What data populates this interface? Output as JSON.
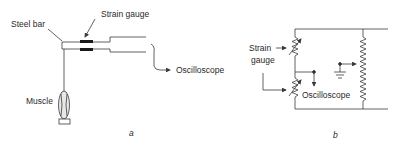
{
  "panel_a": {
    "label": "a",
    "steel_bar_label": "Steel bar",
    "strain_gauge_label": "Strain gauge",
    "oscilloscope_label": "Oscilloscope",
    "muscle_label": "Muscle"
  },
  "panel_b": {
    "label": "b",
    "strain_gauge_label_line1": "Strain",
    "strain_gauge_label_line2": "gauge",
    "oscilloscope_label": "Oscilloscope"
  },
  "colors": {
    "line": "#3a3a3a",
    "text": "#2a2a2a",
    "background": "#ffffff"
  }
}
